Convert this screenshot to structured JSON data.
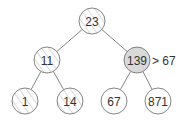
{
  "diagram": {
    "type": "binary-tree",
    "colors": {
      "edge": "#666666",
      "stroke": "#777777",
      "plain_fill": "#ffffff",
      "highlight_fill": "#d9d9d9",
      "hatch": "#aaaaaa"
    },
    "nodes": [
      {
        "id": "n23",
        "label": "23",
        "x": 92,
        "y": 21,
        "style": "hatched"
      },
      {
        "id": "n11",
        "label": "11",
        "x": 47,
        "y": 60,
        "style": "hatched"
      },
      {
        "id": "n139",
        "label": "139",
        "x": 137,
        "y": 60,
        "style": "highlighted"
      },
      {
        "id": "n1",
        "label": "1",
        "x": 25,
        "y": 101,
        "style": "hatched"
      },
      {
        "id": "n14",
        "label": "14",
        "x": 70,
        "y": 101,
        "style": "hatched"
      },
      {
        "id": "n67",
        "label": "67",
        "x": 114,
        "y": 101,
        "style": "plain"
      },
      {
        "id": "n871",
        "label": "871",
        "x": 158,
        "y": 101,
        "style": "plain"
      }
    ],
    "edges": [
      [
        "n23",
        "n11"
      ],
      [
        "n23",
        "n139"
      ],
      [
        "n11",
        "n1"
      ],
      [
        "n11",
        "n14"
      ],
      [
        "n139",
        "n67"
      ],
      [
        "n139",
        "n871"
      ]
    ],
    "annotation": {
      "text": "> 67",
      "x": 152,
      "y": 65
    }
  }
}
